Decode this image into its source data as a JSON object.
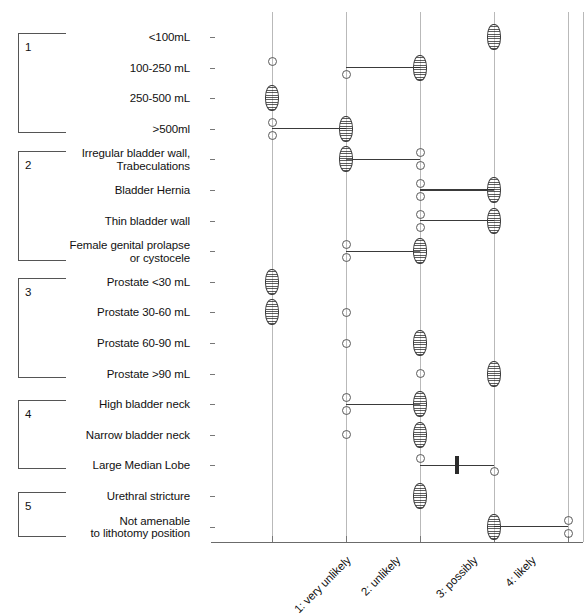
{
  "chart_data": {
    "type": "scatter",
    "title": "",
    "xlabel": "",
    "ylabel": "",
    "xlim": [
      0.5,
      5.5
    ],
    "grid": true,
    "legend": "none",
    "x_tick_values": [
      1,
      2,
      3,
      4,
      5
    ],
    "x_tick_labels": [
      "1: very unlikely",
      "2: unlikely",
      "3: possibly",
      "4: likely",
      "5: very likely"
    ],
    "categories": [
      "<100mL",
      "100-250 mL",
      "250-500 mL",
      ">500ml",
      "Irregular bladder wall,\nTrabeculations",
      "Bladder Hernia",
      "Thin bladder wall",
      "Female genital prolapse\nor cystocele",
      "Prostate <30 mL",
      "Prostate 30-60 mL",
      "Prostate 60-90 mL",
      "Prostate >90 mL",
      "High bladder neck",
      "Narrow bladder neck",
      "Large Median Lobe",
      "Urethral stricture",
      "Not amenable\nto lithotomy position"
    ],
    "groups": [
      {
        "number": "1",
        "first_row": 0,
        "last_row": 3
      },
      {
        "number": "2",
        "first_row": 4,
        "last_row": 7
      },
      {
        "number": "3",
        "first_row": 8,
        "last_row": 11
      },
      {
        "number": "4",
        "first_row": 12,
        "last_row": 14
      },
      {
        "number": "5",
        "first_row": 15,
        "last_row": 16
      }
    ],
    "rows": [
      {
        "category": "<100mL",
        "box": {
          "low": 4,
          "high": 4,
          "median": 4
        },
        "whisker": null,
        "outliers": []
      },
      {
        "category": "100-250 mL",
        "box": {
          "low": 3,
          "high": 3,
          "median": 3
        },
        "whisker": {
          "from": 2,
          "to": 3
        },
        "outliers": [
          1,
          2
        ]
      },
      {
        "category": "250-500 mL",
        "box": {
          "low": 1,
          "high": 1,
          "median": 1
        },
        "whisker": null,
        "outliers": []
      },
      {
        "category": ">500ml",
        "box": {
          "low": 2,
          "high": 2,
          "median": 2
        },
        "whisker": {
          "from": 1,
          "to": 2
        },
        "outliers": [
          1,
          1
        ]
      },
      {
        "category": "Irregular bladder wall,\nTrabeculations",
        "box": {
          "low": 2,
          "high": 2,
          "median": 2
        },
        "whisker": {
          "from": 2,
          "to": 3
        },
        "outliers": [
          3,
          3
        ]
      },
      {
        "category": "Bladder Hernia",
        "box": {
          "low": 4,
          "high": 4,
          "median": 4
        },
        "whisker": {
          "from": 3,
          "to": 4
        },
        "outliers": [
          3,
          3
        ]
      },
      {
        "category": "Thin bladder wall",
        "box": {
          "low": 4,
          "high": 4,
          "median": 4
        },
        "whisker": {
          "from": 3,
          "to": 4
        },
        "outliers": [
          3,
          3
        ]
      },
      {
        "category": "Female genital prolapse\nor cystocele",
        "box": {
          "low": 3,
          "high": 3,
          "median": 3
        },
        "whisker": {
          "from": 2,
          "to": 3
        },
        "outliers": [
          2,
          2
        ]
      },
      {
        "category": "Prostate <30 mL",
        "box": {
          "low": 1,
          "high": 1,
          "median": 1
        },
        "whisker": null,
        "outliers": []
      },
      {
        "category": "Prostate 30-60 mL",
        "box": {
          "low": 1,
          "high": 1,
          "median": 1
        },
        "whisker": null,
        "outliers": [
          2
        ]
      },
      {
        "category": "Prostate 60-90 mL",
        "box": {
          "low": 3,
          "high": 3,
          "median": 3
        },
        "whisker": null,
        "outliers": [
          2
        ]
      },
      {
        "category": "Prostate >90 mL",
        "box": {
          "low": 4,
          "high": 4,
          "median": 4
        },
        "whisker": null,
        "outliers": [
          3
        ]
      },
      {
        "category": "High bladder neck",
        "box": {
          "low": 3,
          "high": 3,
          "median": 3
        },
        "whisker": {
          "from": 2,
          "to": 3
        },
        "outliers": [
          2,
          2
        ]
      },
      {
        "category": "Narrow bladder neck",
        "box": {
          "low": 3,
          "high": 3,
          "median": 3
        },
        "whisker": null,
        "outliers": [
          2
        ]
      },
      {
        "category": "Large Median Lobe",
        "box": null,
        "whisker": {
          "from": 3,
          "to": 4
        },
        "median_bar": 3.5,
        "outliers": [
          3,
          4
        ]
      },
      {
        "category": "Urethral stricture",
        "box": {
          "low": 3,
          "high": 3,
          "median": 3
        },
        "whisker": null,
        "outliers": []
      },
      {
        "category": "Not amenable\nto lithotomy position",
        "box": {
          "low": 4,
          "high": 4,
          "median": 4
        },
        "whisker": {
          "from": 4,
          "to": 5
        },
        "outliers": [
          5,
          5
        ]
      }
    ]
  },
  "colors": {
    "grid": "#b9b9b9",
    "axis": "#6b6b6b",
    "mark": "#3a3a3a",
    "text": "#111111"
  }
}
